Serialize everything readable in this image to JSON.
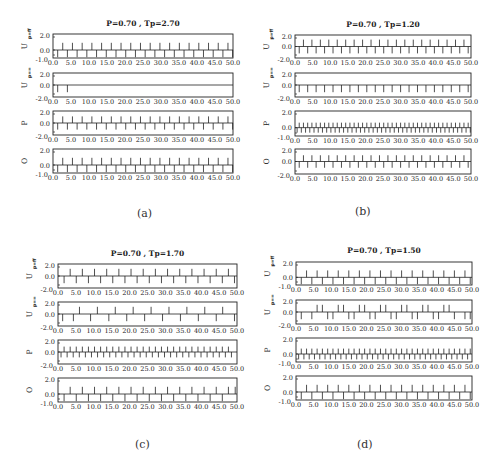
{
  "figure": {
    "captions": [
      "(a)",
      "(b)",
      "(c)",
      "(d)"
    ]
  },
  "chart_data": [
    {
      "type": "line",
      "panel": "(a)",
      "title": "P=0.70 , Tp=2.70",
      "xlim": [
        0,
        50
      ],
      "xticks": [
        "0.0",
        "5.0",
        "10.0",
        "15.0",
        "20.0",
        "25.0",
        "30.0",
        "35.0",
        "40.0",
        "45.0",
        "50.0"
      ],
      "series": [
        {
          "name": "U_p=ff",
          "ylabel": "U p=ff",
          "yticks": [
            "2.0",
            "0.0",
            "-1.0"
          ],
          "ylim": [
            -1,
            2
          ],
          "up": [
            2.7,
            5.4,
            8.1,
            10.8,
            13.5,
            16.2,
            18.9,
            21.6,
            24.3,
            27.0,
            29.7,
            32.4,
            35.1,
            37.8,
            40.5,
            43.2,
            45.9,
            48.6
          ],
          "down": [
            1.3,
            4.0,
            6.7,
            9.4,
            12.1,
            14.8,
            17.5,
            20.2,
            22.9,
            25.6,
            28.3,
            31.0,
            33.7,
            36.4,
            39.1,
            41.8,
            44.5,
            47.2,
            49.9
          ]
        },
        {
          "name": "U_p==",
          "ylabel": "U p==",
          "yticks": [
            "2.0",
            "0.0",
            "-2.0"
          ],
          "ylim": [
            -2,
            2
          ],
          "up": [],
          "down": [
            1.3,
            4.0
          ]
        },
        {
          "name": "P",
          "ylabel": "P",
          "yticks": [
            "2.0",
            "0.0",
            "-2.0"
          ],
          "ylim": [
            -2,
            2
          ],
          "up": [
            2.7,
            5.4,
            8.1,
            10.8,
            13.5,
            16.2,
            18.9,
            21.6,
            24.3,
            27.0,
            29.7,
            32.4,
            35.1,
            37.8,
            40.5,
            43.2,
            45.9,
            48.6
          ],
          "down": [
            1.3,
            4.0,
            6.7,
            9.4,
            12.1,
            14.8,
            17.5,
            20.2,
            22.9,
            25.6,
            28.3,
            31.0,
            33.7,
            36.4,
            39.1,
            41.8,
            44.5,
            47.2,
            49.9
          ],
          "amp": 0.55
        },
        {
          "name": "O",
          "ylabel": "O",
          "yticks": [
            "2.0",
            "0.0",
            "-1.0"
          ],
          "ylim": [
            -1,
            2
          ],
          "up": [
            2.7,
            5.4,
            8.1,
            10.8,
            13.5,
            16.2,
            18.9,
            21.6,
            24.3,
            27.0,
            29.7,
            32.4,
            35.1,
            37.8,
            40.5,
            43.2,
            45.9,
            48.6
          ],
          "down": [
            1.3,
            4.0,
            6.7,
            9.4,
            12.1,
            14.8,
            17.5,
            20.2,
            22.9,
            25.6,
            28.3,
            31.0,
            33.7,
            36.4,
            39.1,
            41.8,
            44.5,
            47.2,
            49.9
          ]
        }
      ]
    },
    {
      "type": "line",
      "panel": "(b)",
      "title": "P=0.70 , Tp=1.20",
      "xlim": [
        0,
        50
      ],
      "xticks": [
        "0.0",
        "5.0",
        "10.0",
        "15.0",
        "20.0",
        "25.0",
        "30.0",
        "35.0",
        "40.0",
        "45.0",
        "50.0"
      ],
      "series": [
        {
          "name": "U_p=ff",
          "ylabel": "U p=ff",
          "yticks": [
            "2.0",
            "0.0",
            "-2.0"
          ],
          "ylim": [
            -2,
            2
          ],
          "up": [
            2.4,
            4.8,
            7.2,
            9.6,
            12.0,
            14.4,
            16.8,
            19.2,
            21.6,
            24.0,
            26.4,
            28.8,
            31.2,
            33.6,
            36.0,
            38.4,
            40.8,
            43.2,
            45.6,
            48.0
          ],
          "down": [
            1.2,
            3.6,
            6.0,
            8.4,
            10.8,
            13.2,
            15.6,
            18.0,
            20.4,
            22.8,
            25.2,
            27.6,
            30.0,
            32.4,
            34.8,
            37.2,
            39.6,
            42.0,
            44.4,
            46.8,
            49.2
          ]
        },
        {
          "name": "U_p==",
          "ylabel": "U p==",
          "yticks": [
            "2.0",
            "0.0",
            "-2.0"
          ],
          "ylim": [
            -2,
            2
          ],
          "up": [],
          "down": [
            1.2,
            3.6,
            6.0,
            8.4,
            10.8,
            13.2,
            15.6,
            18.0,
            20.4,
            22.8,
            25.2,
            27.6,
            30.0,
            32.4,
            34.8,
            37.2,
            39.6,
            42.0,
            44.4,
            46.8,
            49.2
          ]
        },
        {
          "name": "P",
          "ylabel": "P",
          "yticks": [
            "2.0",
            "0.0",
            "-1.0"
          ],
          "ylim": [
            -1,
            2
          ],
          "up": [
            1.2,
            2.4,
            3.6,
            4.8,
            6.0,
            7.2,
            8.4,
            9.6,
            10.8,
            12.0,
            13.2,
            14.4,
            15.6,
            16.8,
            18.0,
            19.2,
            20.4,
            21.6,
            22.8,
            24.0,
            25.2,
            26.4,
            27.6,
            28.8,
            30.0,
            31.2,
            32.4,
            33.6,
            34.8,
            36.0,
            37.2,
            38.4,
            39.6,
            40.8,
            42.0,
            43.2,
            44.4,
            45.6,
            46.8,
            48.0,
            49.2
          ],
          "down": [
            0.6,
            1.8,
            3.0,
            4.2,
            5.4,
            6.6,
            7.8,
            9.0,
            10.2,
            11.4,
            12.6,
            13.8,
            15.0,
            16.2,
            17.4,
            18.6,
            19.8,
            21.0,
            22.2,
            23.4,
            24.6,
            25.8,
            27.0,
            28.2,
            29.4,
            30.6,
            31.8,
            33.0,
            34.2,
            35.4,
            36.6,
            37.8,
            39.0,
            40.2,
            41.4,
            42.6,
            43.8,
            45.0,
            46.2,
            47.4,
            48.6,
            49.8
          ],
          "amp": 0.4
        },
        {
          "name": "O",
          "ylabel": "O",
          "yticks": [
            "2.0",
            "0.0",
            "-2.0"
          ],
          "ylim": [
            -2,
            2
          ],
          "up": [
            2.4,
            4.8,
            7.2,
            9.6,
            12.0,
            14.4,
            16.8,
            19.2,
            21.6,
            24.0,
            26.4,
            28.8,
            31.2,
            33.6,
            36.0,
            38.4,
            40.8,
            43.2,
            45.6,
            48.0
          ],
          "down": [
            1.2,
            3.6,
            6.0,
            8.4,
            10.8,
            13.2,
            15.6,
            18.0,
            20.4,
            22.8,
            25.2,
            27.6,
            30.0,
            32.4,
            34.8,
            37.2,
            39.6,
            42.0,
            44.4,
            46.8,
            49.2
          ],
          "amp": 0.5
        }
      ]
    },
    {
      "type": "line",
      "panel": "(c)",
      "title": "P=0.70 , Tp=1.70",
      "xlim": [
        0,
        50
      ],
      "xticks": [
        "0.0",
        "5.0",
        "10.0",
        "15.0",
        "20.0",
        "25.0",
        "30.0",
        "35.0",
        "40.0",
        "45.0",
        "50.0"
      ],
      "series": [
        {
          "name": "U_p=ff",
          "ylabel": "U p=ff",
          "yticks": [
            "2.0",
            "0.0",
            "-2.0"
          ],
          "ylim": [
            -2,
            2
          ],
          "up": [
            3.4,
            6.8,
            10.2,
            13.6,
            17.0,
            20.4,
            23.8,
            27.2,
            30.6,
            34.0,
            37.4,
            40.8,
            44.2,
            47.6
          ],
          "down": [
            1.7,
            5.1,
            8.5,
            11.9,
            15.3,
            18.7,
            22.1,
            25.5,
            28.9,
            32.3,
            35.7,
            39.1,
            42.5,
            45.9,
            49.3
          ]
        },
        {
          "name": "U_p==",
          "ylabel": "U p==",
          "yticks": [
            "2.0",
            "0.0",
            "-2.0"
          ],
          "ylim": [
            -2,
            2
          ],
          "up": [
            6.0,
            11.0,
            16.0,
            21.0,
            26.0,
            31.0,
            36.0,
            41.0,
            46.0
          ],
          "down": [
            1.3,
            4.3,
            9.1,
            14.2,
            19.2,
            24.2,
            29.2,
            34.2,
            39.2,
            44.2,
            49.3
          ]
        },
        {
          "name": "P",
          "ylabel": "P",
          "yticks": [
            "2.0",
            "0.0",
            "-2.0"
          ],
          "ylim": [
            -2,
            2
          ],
          "up": [
            1.7,
            3.4,
            5.1,
            6.8,
            8.5,
            10.2,
            11.9,
            13.6,
            15.3,
            17.0,
            18.7,
            20.4,
            22.1,
            23.8,
            25.5,
            27.2,
            28.9,
            30.6,
            32.3,
            34.0,
            35.7,
            37.4,
            39.1,
            40.8,
            42.5,
            44.2,
            45.9,
            47.6
          ],
          "down": [
            0.85,
            2.55,
            4.25,
            5.95,
            7.65,
            9.35,
            11.05,
            12.75,
            14.45,
            16.15,
            17.85,
            19.55,
            21.25,
            22.95,
            24.65,
            26.35,
            28.05,
            29.75,
            31.45,
            33.15,
            34.85,
            36.55,
            38.25,
            39.95,
            41.65,
            43.35,
            45.05,
            46.75,
            48.45
          ],
          "amp": 0.45
        },
        {
          "name": "O",
          "ylabel": "O",
          "yticks": [
            "2.0",
            "0.0",
            "-1.0"
          ],
          "ylim": [
            -1,
            2
          ],
          "up": [
            3.4,
            6.8,
            10.2,
            13.6,
            17.0,
            20.4,
            23.8,
            27.2,
            30.6,
            34.0,
            37.4,
            40.8,
            44.2,
            47.6,
            49.5
          ],
          "down": [
            1.7,
            5.1,
            8.5,
            11.9,
            15.3,
            18.7,
            22.1,
            25.5,
            28.9,
            32.3,
            35.7,
            39.1,
            42.5,
            45.9
          ]
        }
      ]
    },
    {
      "type": "line",
      "panel": "(d)",
      "title": "P=0.70 , Tp=1.50",
      "xlim": [
        0,
        50
      ],
      "xticks": [
        "0.0",
        "5.0",
        "10.0",
        "15.0",
        "20.0",
        "25.0",
        "30.0",
        "35.0",
        "40.0",
        "45.0",
        "50.0"
      ],
      "series": [
        {
          "name": "U_p=ff",
          "ylabel": "U p=ff",
          "yticks": [
            "2.0",
            "0.0",
            "-1.0"
          ],
          "ylim": [
            -1,
            2
          ],
          "up": [
            3.0,
            6.0,
            9.0,
            12.0,
            15.0,
            18.0,
            21.0,
            24.0,
            27.0,
            30.0,
            33.0,
            36.0,
            39.0,
            42.0,
            45.0,
            48.0
          ],
          "down": [
            1.5,
            4.5,
            7.5,
            10.5,
            13.5,
            16.5,
            19.5,
            22.5,
            25.5,
            28.5,
            31.5,
            34.5,
            37.5,
            40.5,
            43.5,
            46.5,
            49.5
          ]
        },
        {
          "name": "U_p==",
          "ylabel": "U p==",
          "yticks": [
            "2.0",
            "0.0",
            "-2.0"
          ],
          "ylim": [
            -2,
            2
          ],
          "up": [
            6.0,
            7.5,
            12.0,
            13.5,
            18.0,
            19.5,
            24.0,
            25.5,
            30.0,
            31.5,
            36.0,
            37.5,
            42.0,
            43.5
          ],
          "down": [
            1.5,
            4.5,
            9.0,
            10.5,
            15.0,
            16.5,
            21.0,
            22.5,
            27.0,
            28.5,
            33.0,
            34.5,
            39.0,
            40.5,
            45.0,
            48.0,
            49.5
          ]
        },
        {
          "name": "P",
          "ylabel": "P",
          "yticks": [
            "2.0",
            "0.0",
            "-1.0"
          ],
          "ylim": [
            -1,
            2
          ],
          "up": [
            1.5,
            3.0,
            4.5,
            6.0,
            7.5,
            9.0,
            10.5,
            12.0,
            13.5,
            15.0,
            16.5,
            18.0,
            19.5,
            21.0,
            22.5,
            24.0,
            25.5,
            27.0,
            28.5,
            30.0,
            31.5,
            33.0,
            34.5,
            36.0,
            37.5,
            39.0,
            40.5,
            42.0,
            43.5,
            45.0,
            46.5,
            48.0,
            49.5
          ],
          "down": [
            0.75,
            2.25,
            3.75,
            5.25,
            6.75,
            8.25,
            9.75,
            11.25,
            12.75,
            14.25,
            15.75,
            17.25,
            18.75,
            20.25,
            21.75,
            23.25,
            24.75,
            26.25,
            27.75,
            29.25,
            30.75,
            32.25,
            33.75,
            35.25,
            36.75,
            38.25,
            39.75,
            41.25,
            42.75,
            44.25,
            45.75,
            47.25,
            48.75
          ],
          "amp": 0.45
        },
        {
          "name": "O",
          "ylabel": "O",
          "yticks": [
            "2.0",
            "0.0",
            "-1.0"
          ],
          "ylim": [
            -1,
            2
          ],
          "up": [
            3.0,
            6.0,
            9.0,
            12.0,
            15.0,
            18.0,
            21.0,
            24.0,
            27.0,
            30.0,
            33.0,
            36.0,
            39.0,
            42.0,
            45.0,
            48.0
          ],
          "down": [
            1.5,
            4.5,
            7.5,
            10.5,
            13.5,
            16.5,
            19.5,
            22.5,
            25.5,
            28.5,
            31.5,
            34.5,
            37.5,
            40.5,
            43.5,
            46.5,
            49.5
          ]
        }
      ]
    }
  ],
  "layout": {
    "panels": [
      {
        "left": 53,
        "right": 233,
        "title_y": 26,
        "rows": [
          [
            34,
            58
          ],
          [
            73,
            97
          ],
          [
            111,
            135
          ],
          [
            149,
            173
          ]
        ],
        "caption_x": 143,
        "caption_y": 208
      },
      {
        "left": 295,
        "right": 471,
        "title_y": 27,
        "rows": [
          [
            35,
            58
          ],
          [
            73,
            97
          ],
          [
            111,
            136
          ],
          [
            149,
            174
          ]
        ],
        "caption_x": 361,
        "caption_y": 206
      },
      {
        "left": 58,
        "right": 237,
        "title_y": 256,
        "rows": [
          [
            264,
            288
          ],
          [
            302,
            326
          ],
          [
            340,
            364
          ],
          [
            378,
            402
          ]
        ],
        "caption_x": 141,
        "caption_y": 439
      },
      {
        "left": 296,
        "right": 472,
        "title_y": 253,
        "rows": [
          [
            262,
            285
          ],
          [
            300,
            324
          ],
          [
            338,
            362
          ],
          [
            376,
            400
          ]
        ],
        "caption_x": 363,
        "caption_y": 439
      }
    ]
  }
}
